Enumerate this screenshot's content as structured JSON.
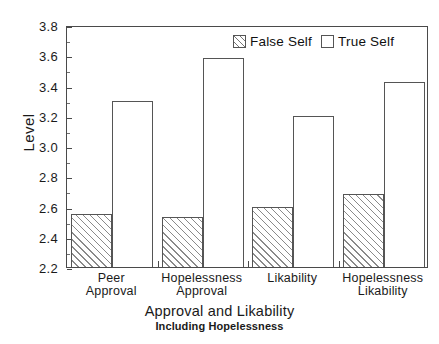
{
  "chart_data": {
    "type": "bar",
    "title": "",
    "xlabel": "Approval and Likability",
    "xsublabel": "Including Hopelessness",
    "ylabel": "Level",
    "ylim": [
      2.2,
      3.8
    ],
    "ytick_values": [
      2.2,
      2.4,
      2.6,
      2.8,
      3.0,
      3.2,
      3.4,
      3.6,
      3.8
    ],
    "ytick_labels": [
      "2.2",
      "2.4",
      "2.6",
      "2.8",
      "3.0",
      "3.2",
      "3.4",
      "3.6",
      "3.8"
    ],
    "minor_ticks": true,
    "grid": false,
    "legend_position": "top-right",
    "categories": [
      {
        "line1": "Peer",
        "line2": "Approval"
      },
      {
        "line1": "Hopelessness",
        "line2": "Approval"
      },
      {
        "line1": "Likability",
        "line2": ""
      },
      {
        "line1": "Hopelessness",
        "line2": "Likability"
      }
    ],
    "series": [
      {
        "name": "False Self",
        "fill": "diagonal-hatch",
        "edge_color": "#555555",
        "values": [
          2.55,
          2.53,
          2.6,
          2.68
        ]
      },
      {
        "name": "True Self",
        "fill": "none",
        "edge_color": "#555555",
        "values": [
          3.3,
          3.58,
          3.2,
          3.42
        ]
      }
    ]
  },
  "legend": {
    "items": [
      {
        "label": "False Self",
        "swatch": "hatched-swatch"
      },
      {
        "label": "True Self",
        "swatch": "empty-swatch"
      }
    ]
  }
}
